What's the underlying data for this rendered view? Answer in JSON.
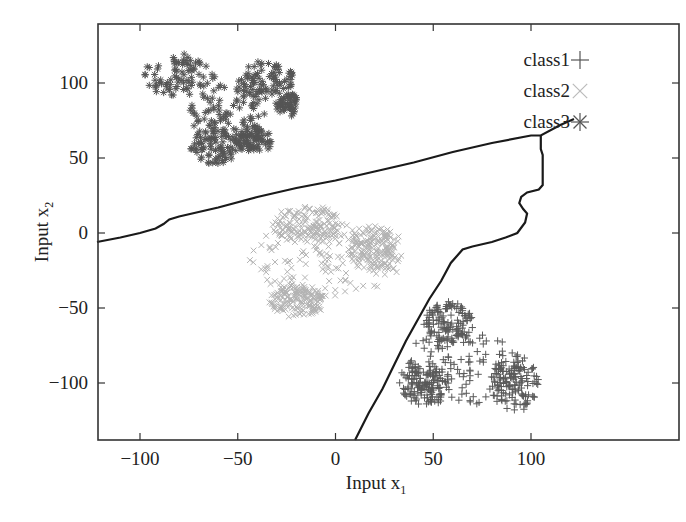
{
  "chart_data": {
    "type": "scatter",
    "title": "",
    "xlabel": "Input x",
    "xlabel_subscript": "1",
    "ylabel": "Input x",
    "ylabel_subscript": "2",
    "xlim": [
      -122,
      122
    ],
    "ylim": [
      -138,
      140
    ],
    "grid": false,
    "legend_position": "upper right (inside)",
    "x_ticks": [
      -100,
      -50,
      0,
      50,
      100
    ],
    "x_tick_labels": [
      "−100",
      "−50",
      "0",
      "50",
      "100"
    ],
    "y_ticks": [
      -100,
      -50,
      0,
      50,
      100
    ],
    "y_tick_labels": [
      "−100",
      "−50",
      "0",
      "50",
      "100"
    ],
    "legend": [
      {
        "label": "class1",
        "marker": "plus",
        "color": "#555555"
      },
      {
        "label": "class2",
        "marker": "cross",
        "color": "#b0b0b0"
      },
      {
        "label": "class3",
        "marker": "star",
        "color": "#555555"
      }
    ],
    "series": [
      {
        "name": "class3",
        "marker": "star",
        "color": "#555555",
        "cluster_center": [
          -55,
          90
        ],
        "x_range": [
          -100,
          -20
        ],
        "y_range": [
          45,
          122
        ],
        "approx_points": 500,
        "blobs": [
          {
            "cx": -80,
            "cy": 105,
            "rx": 18,
            "ry": 14
          },
          {
            "cx": -35,
            "cy": 102,
            "rx": 15,
            "ry": 13
          },
          {
            "cx": -55,
            "cy": 80,
            "rx": 20,
            "ry": 18
          },
          {
            "cx": -62,
            "cy": 58,
            "rx": 12,
            "ry": 12
          },
          {
            "cx": -22,
            "cy": 85,
            "rx": 8,
            "ry": 7
          },
          {
            "cx": -42,
            "cy": 62,
            "rx": 10,
            "ry": 8
          }
        ]
      },
      {
        "name": "class2",
        "marker": "cross",
        "color": "#b3b3b3",
        "cluster_center": [
          -5,
          -18
        ],
        "x_range": [
          -45,
          35
        ],
        "y_range": [
          -58,
          22
        ],
        "approx_points": 600,
        "blobs": [
          {
            "cx": -5,
            "cy": -18,
            "rx": 38,
            "ry": 28
          },
          {
            "cx": -15,
            "cy": 5,
            "rx": 18,
            "ry": 12
          },
          {
            "cx": 20,
            "cy": -10,
            "rx": 14,
            "ry": 14
          },
          {
            "cx": -20,
            "cy": -45,
            "rx": 14,
            "ry": 10
          }
        ]
      },
      {
        "name": "class1",
        "marker": "plus",
        "color": "#5a5a5a",
        "cluster_center": [
          68,
          -90
        ],
        "x_range": [
          30,
          105
        ],
        "y_range": [
          -125,
          -42
        ],
        "approx_points": 500,
        "blobs": [
          {
            "cx": 65,
            "cy": -90,
            "rx": 30,
            "ry": 25
          },
          {
            "cx": 92,
            "cy": -100,
            "rx": 12,
            "ry": 18
          },
          {
            "cx": 58,
            "cy": -60,
            "rx": 12,
            "ry": 14
          },
          {
            "cx": 45,
            "cy": -100,
            "rx": 12,
            "ry": 14
          }
        ]
      }
    ],
    "decision_boundaries": [
      {
        "name": "boundary class3 vs others",
        "color": "#1a1a1a",
        "points": [
          [
            -122,
            -6
          ],
          [
            -110,
            -3
          ],
          [
            -100,
            0
          ],
          [
            -92,
            3
          ],
          [
            -88,
            6
          ],
          [
            -85,
            9
          ],
          [
            -80,
            11
          ],
          [
            -60,
            17
          ],
          [
            -40,
            24
          ],
          [
            -20,
            30
          ],
          [
            0,
            35
          ],
          [
            20,
            41
          ],
          [
            40,
            47
          ],
          [
            60,
            54
          ],
          [
            80,
            60
          ],
          [
            100,
            65
          ],
          [
            105,
            65
          ],
          [
            115,
            72
          ],
          [
            122,
            76
          ]
        ]
      },
      {
        "name": "boundary class1 vs class2",
        "color": "#1a1a1a",
        "points": [
          [
            105,
            65
          ],
          [
            105,
            56
          ],
          [
            106,
            52
          ],
          [
            106,
            32
          ],
          [
            104,
            29
          ],
          [
            98,
            27
          ],
          [
            95,
            24
          ],
          [
            94,
            20
          ],
          [
            96,
            16
          ],
          [
            98,
            13
          ],
          [
            97,
            7
          ],
          [
            93,
            0
          ],
          [
            87,
            -3
          ],
          [
            80,
            -6
          ],
          [
            70,
            -9
          ],
          [
            65,
            -11
          ],
          [
            59,
            -20
          ],
          [
            54,
            -32
          ],
          [
            48,
            -44
          ],
          [
            42,
            -58
          ],
          [
            36,
            -72
          ],
          [
            30,
            -88
          ],
          [
            24,
            -104
          ],
          [
            17,
            -120
          ],
          [
            10,
            -138
          ]
        ]
      }
    ]
  }
}
